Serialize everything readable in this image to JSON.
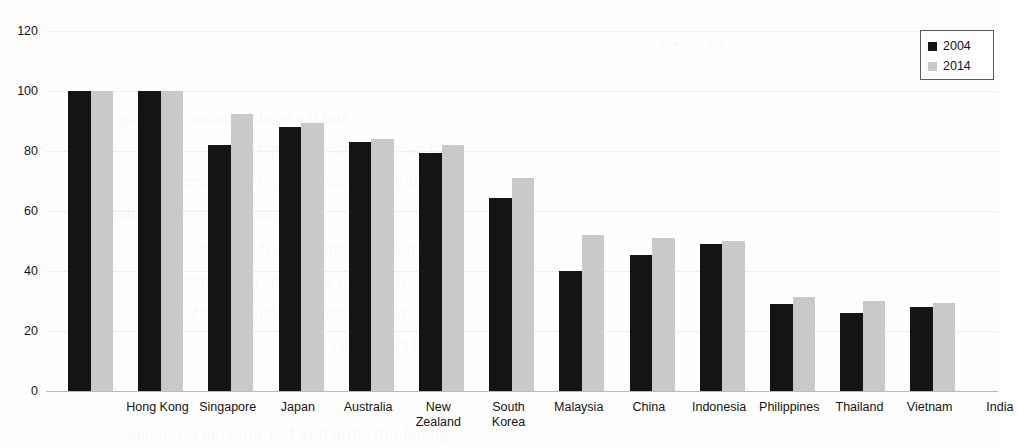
{
  "chart_data": {
    "type": "bar",
    "title": "",
    "xlabel": "",
    "ylabel": "",
    "ylim": [
      0,
      120
    ],
    "yticks": [
      0,
      20,
      40,
      60,
      80,
      100,
      120
    ],
    "grid": true,
    "legend_position": "top-right",
    "categories": [
      "Hong Kong",
      "Singapore",
      "Japan",
      "Australia",
      "New\nZealand",
      "South\nKorea",
      "Malaysia",
      "China",
      "Indonesia",
      "Philippines",
      "Thailand",
      "Vietnam",
      "India"
    ],
    "series": [
      {
        "name": "2004",
        "color": "#141414",
        "values": [
          100,
          100,
          82,
          88,
          83,
          79.5,
          64.5,
          40,
          45.5,
          49,
          29,
          26,
          28
        ]
      },
      {
        "name": "2014",
        "color": "#c9c9c9",
        "values": [
          100,
          100,
          92.5,
          89.5,
          84,
          82,
          71,
          52,
          51,
          50,
          31.5,
          30,
          29.5
        ]
      }
    ]
  },
  "legend": {
    "entries": [
      {
        "label": "2004",
        "swatch": "legend-swatch-2004"
      },
      {
        "label": "2014",
        "swatch": "legend-swatch-2014"
      }
    ]
  },
  "background_bleed": [
    {
      "text": "Chapter 3",
      "x": 660,
      "y": 36,
      "size": 15
    },
    {
      "text": "and the world's fastest-growing",
      "x": 120,
      "y": 108,
      "size": 17
    },
    {
      "text": "in a memorandum of understanding",
      "x": 210,
      "y": 140,
      "size": 16
    },
    {
      "text": "rapidly distribute goods, via an extensive",
      "x": 160,
      "y": 172,
      "size": 16
    },
    {
      "text": "can be accessed in a day",
      "x": 110,
      "y": 204,
      "size": 16
    },
    {
      "text": "in the trade of goods across the region",
      "x": 200,
      "y": 240,
      "size": 16
    },
    {
      "text": "it remains one of the most competitive",
      "x": 140,
      "y": 272,
      "size": 16
    },
    {
      "text": "regional and international markets",
      "x": 170,
      "y": 304,
      "size": 16
    },
    {
      "text": "it is a key logistics hub",
      "x": 300,
      "y": 336,
      "size": 16
    },
    {
      "text": "global infrastructure fast-growing economies",
      "x": 120,
      "y": 424,
      "size": 17
    }
  ]
}
